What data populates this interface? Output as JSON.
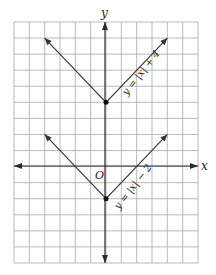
{
  "chart_data": {
    "type": "line",
    "title": "",
    "xlabel": "x",
    "ylabel": "y",
    "origin_label": "O",
    "xlim": [
      -6,
      6
    ],
    "ylim": [
      -6,
      9
    ],
    "grid": true,
    "grid_step": 1,
    "series": [
      {
        "name": "y = |x| + 4",
        "label": "y = |x| + 4",
        "vertex": [
          0,
          4
        ],
        "points": [
          [
            -4,
            8
          ],
          [
            0,
            4
          ],
          [
            4,
            8
          ]
        ]
      },
      {
        "name": "y = |x| − 2",
        "label": "y = |x| − 2",
        "vertex": [
          0,
          -2
        ],
        "points": [
          [
            -4,
            2
          ],
          [
            0,
            -2
          ],
          [
            4,
            2
          ]
        ]
      }
    ]
  },
  "colors": {
    "grid": "#a8a8a8",
    "axis": "#2a2a2a",
    "curve": "#333333"
  }
}
